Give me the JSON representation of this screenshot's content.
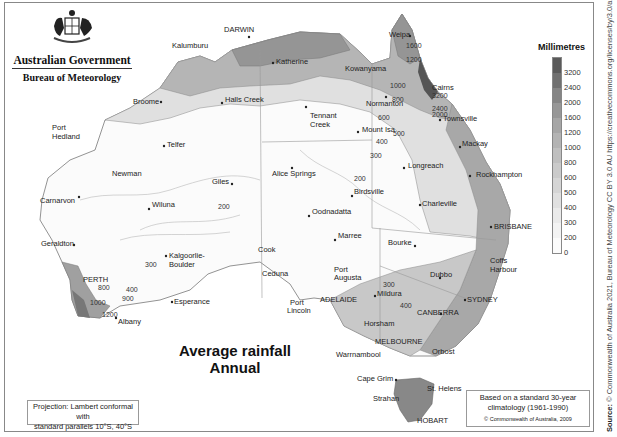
{
  "header": {
    "government": "Australian Government",
    "agency": "Bureau of Meteorology",
    "logo_icon": "coat-of-arms-icon"
  },
  "map": {
    "title_line1": "Average rainfall",
    "title_line2": "Annual",
    "projection_note_line1": "Projection: Lambert conformal with",
    "projection_note_line2": "standard parallels 10°S, 40°S",
    "climatology_line1": "Based on a standard 30-year",
    "climatology_line2": "climatology (1961-1990)",
    "copyright": "© Commonwealth of Australia, 2009",
    "source_label": "Source:",
    "source_text": "© Commonwealth of Australia 2021, Bureau of Meteorology CC BY 3.0 AU https://creativecommons.org/licenses/by/3.0/au/"
  },
  "legend": {
    "title": "Millimetres",
    "ticks": [
      "3200",
      "2400",
      "2000",
      "1600",
      "1200",
      "1000",
      "800",
      "600",
      "500",
      "400",
      "300",
      "200",
      "0"
    ],
    "colors": [
      "#5a5a5a",
      "#707070",
      "#858585",
      "#979797",
      "#a6a6a6",
      "#b3b3b3",
      "#bfbfbf",
      "#cacaca",
      "#d5d5d5",
      "#e0e0e0",
      "#eaeaea",
      "#f3f3f3",
      "#fbfbfb"
    ]
  },
  "places": {
    "darwin": "DARWIN",
    "kalumburu": "Kalumburu",
    "katherine": "Katherine",
    "weipa": "Weipa",
    "kowanyama": "Kowanyama",
    "cairns": "Cairns",
    "broome": "Broome",
    "halls_creek": "Halls Creek",
    "tennant_creek_1": "Tennant",
    "tennant_creek_2": "Creek",
    "normanton": "Normanton",
    "townsville": "Townsville",
    "port_hedland_1": "Port",
    "port_hedland_2": "Hedland",
    "mount_isa": "Mount Isa",
    "mackay": "Mackay",
    "telfer": "Telfer",
    "newman": "Newman",
    "longreach": "Longreach",
    "rockhampton": "Rockhampton",
    "giles": "Giles",
    "alice_springs": "Alice Springs",
    "wiluna": "Wiluna",
    "birdsville": "Birdsville",
    "carnarvon": "Carnarvon",
    "charleville": "Charleville",
    "oodnadatta": "Oodnadatta",
    "brisbane": "BRISBANE",
    "geraldton": "Geraldton",
    "marree": "Marree",
    "bourke": "Bourke",
    "coffs_1": "Coffs",
    "coffs_2": "Harbour",
    "cook": "Cook",
    "kalgoorlie_1": "Kalgoorlie-",
    "kalgoorlie_2": "Boulder",
    "perth": "PERTH",
    "ceduna": "Ceduna",
    "port_augusta_1": "Port",
    "port_augusta_2": "Augusta",
    "dubbo": "Dubbo",
    "esperance": "Esperance",
    "adelaide": "ADELAIDE",
    "mildura": "Mildura",
    "sydney": "SYDNEY",
    "port_lincoln_1": "Port",
    "port_lincoln_2": "Lincoln",
    "canberra": "CANBERRA",
    "albany": "Albany",
    "horsham": "Horsham",
    "melbourne": "MELBOURNE",
    "warrnambool": "Warrnambool",
    "orbost": "Orbost",
    "cape_grim": "Cape Grim",
    "st_helens": "St. Helens",
    "strahan": "Strahan",
    "hobart": "HOBART"
  },
  "contours": {
    "c1600": "1600",
    "c1200": "1200",
    "c1000": "1000",
    "c800": "800",
    "c3200": "3200",
    "c2400": "2400",
    "c2000": "2000",
    "c600": "600",
    "c500": "500",
    "c400": "400",
    "c300": "300",
    "c200": "200",
    "c200b": "200",
    "c300b": "300",
    "c400b": "400",
    "c300w": "300",
    "c800w": "800",
    "c400w": "400",
    "c900w": "900",
    "c1000w": "1000",
    "c1200w": "1200"
  }
}
